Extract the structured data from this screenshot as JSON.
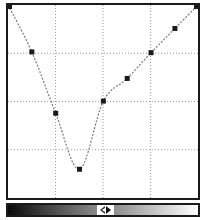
{
  "curves_panel": {
    "grid_divisions": 4,
    "colors": {
      "frame": "#1a1a1a",
      "grid": "#9a9a9a",
      "curve": "#7a7a7a",
      "point": "#1a1a1a"
    },
    "points": [
      {
        "input": 0,
        "output": 255
      },
      {
        "input": 32,
        "output": 193
      },
      {
        "input": 64,
        "output": 112
      },
      {
        "input": 96,
        "output": 38
      },
      {
        "input": 128,
        "output": 128
      },
      {
        "input": 160,
        "output": 158
      },
      {
        "input": 192,
        "output": 192
      },
      {
        "input": 224,
        "output": 224
      },
      {
        "input": 255,
        "output": 255
      }
    ]
  },
  "gradient_bar": {
    "start_color": "#0a0a0a",
    "end_color": "#ffffff",
    "toggle_icon": "swap-arrows-icon"
  }
}
